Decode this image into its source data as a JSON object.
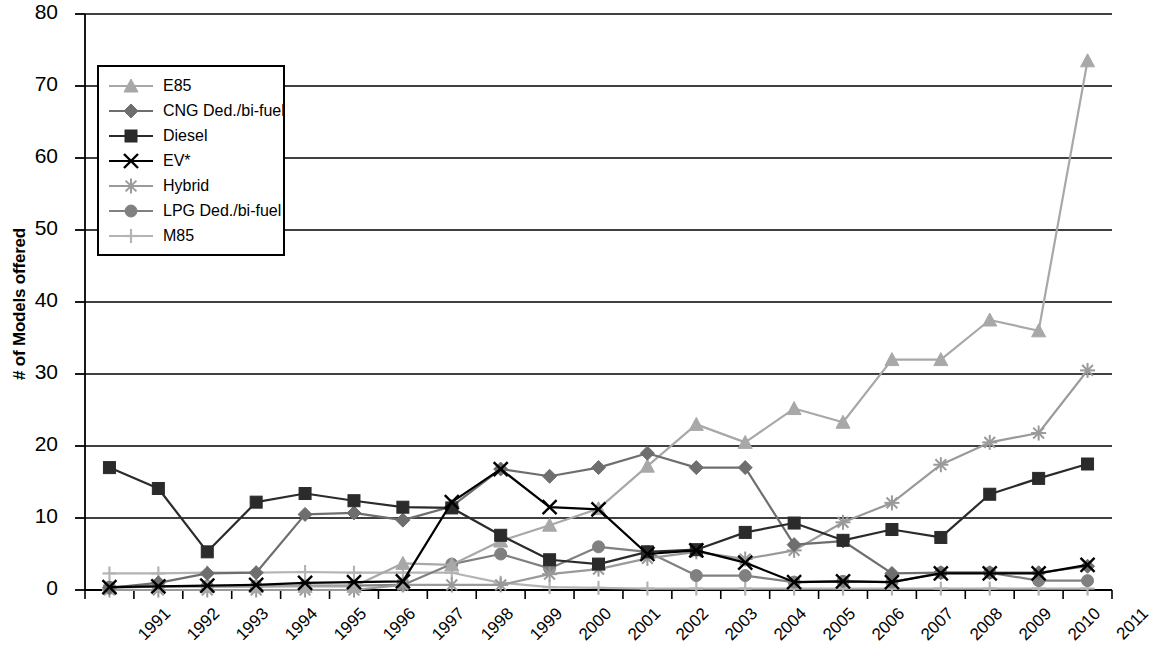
{
  "chart_data": {
    "type": "line",
    "title": "",
    "xlabel": "",
    "ylabel": "# of Models offered",
    "ylim": [
      0,
      80
    ],
    "ytick_step": 10,
    "grid": true,
    "legend_position": "top-left inside",
    "categories": [
      "1991",
      "1992",
      "1993",
      "1994",
      "1995",
      "1996",
      "1997",
      "1998",
      "1999",
      "2000",
      "2001",
      "2002",
      "2003",
      "2004",
      "2005",
      "2006",
      "2007",
      "2008",
      "2009",
      "2010",
      "2011"
    ],
    "yticks": [
      "0",
      "10",
      "20",
      "30",
      "40",
      "50",
      "60",
      "70",
      "80"
    ],
    "series": [
      {
        "name": "E85",
        "marker": "triangle",
        "color": "#a8a8a8",
        "values": [
          0.3,
          0.5,
          0.5,
          0.5,
          0.5,
          0.5,
          3.7,
          3.5,
          6.8,
          9.0,
          11.3,
          17.2,
          23.0,
          20.5,
          25.2,
          23.3,
          32.0,
          32.0,
          37.5,
          36.0,
          73.5
        ]
      },
      {
        "name": "CNG Ded./bi-fuel",
        "marker": "diamond",
        "color": "#6e6e6e",
        "values": [
          0.3,
          1.0,
          2.3,
          2.4,
          10.5,
          10.7,
          9.7,
          11.6,
          16.8,
          15.8,
          17.0,
          19.0,
          17.0,
          17.0,
          6.3,
          6.8,
          2.3,
          2.4,
          2.4,
          2.4,
          3.3
        ]
      },
      {
        "name": "Diesel",
        "marker": "square",
        "color": "#2b2b2b",
        "values": [
          17.0,
          14.1,
          5.3,
          12.2,
          13.4,
          12.4,
          11.5,
          11.4,
          7.6,
          4.2,
          3.6,
          5.3,
          5.6,
          8.0,
          9.3,
          6.9,
          8.4,
          7.3,
          13.3,
          15.5,
          17.5
        ]
      },
      {
        "name": "EV*",
        "marker": "cross",
        "color": "#000000",
        "values": [
          0.4,
          0.5,
          0.6,
          0.7,
          1.0,
          1.1,
          1.2,
          12.2,
          16.8,
          11.5,
          11.2,
          5.0,
          5.5,
          3.8,
          1.1,
          1.2,
          1.1,
          2.3,
          2.3,
          2.3,
          3.5
        ]
      },
      {
        "name": "Hybrid",
        "marker": "asterisk",
        "color": "#9a9a9a",
        "values": [
          0.0,
          0.0,
          0.0,
          0.0,
          0.0,
          0.0,
          0.7,
          0.7,
          0.7,
          2.2,
          2.9,
          4.4,
          5.3,
          4.3,
          5.5,
          9.4,
          12.1,
          17.4,
          20.5,
          21.8,
          30.5
        ]
      },
      {
        "name": "LPG Ded./bi-fuel",
        "marker": "circle",
        "color": "#808080",
        "values": [
          0.4,
          0.5,
          0.5,
          0.5,
          0.6,
          0.6,
          0.7,
          3.6,
          5.0,
          3.0,
          6.0,
          5.3,
          2.0,
          2.0,
          1.1,
          1.2,
          1.1,
          2.4,
          2.4,
          1.3,
          1.3
        ]
      },
      {
        "name": "M85",
        "marker": "plus",
        "color": "#b4b4b4",
        "values": [
          2.3,
          2.3,
          2.4,
          2.4,
          2.5,
          2.4,
          2.4,
          2.4,
          1.0,
          0.4,
          0.3,
          0.2,
          0.2,
          0.2,
          0.2,
          0.2,
          0.2,
          0.2,
          0.2,
          0.2,
          0.2
        ]
      }
    ]
  },
  "axis": {
    "y_label": "# of Models offered"
  }
}
